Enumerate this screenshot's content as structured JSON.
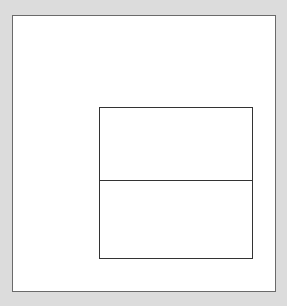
{
  "diagram": {
    "top_caption": "",
    "outer_frame": {
      "border_color": "#6a6a6a",
      "fill": "#ffffff"
    },
    "inner_box": {
      "border_color": "#333333",
      "sections": 2
    }
  }
}
